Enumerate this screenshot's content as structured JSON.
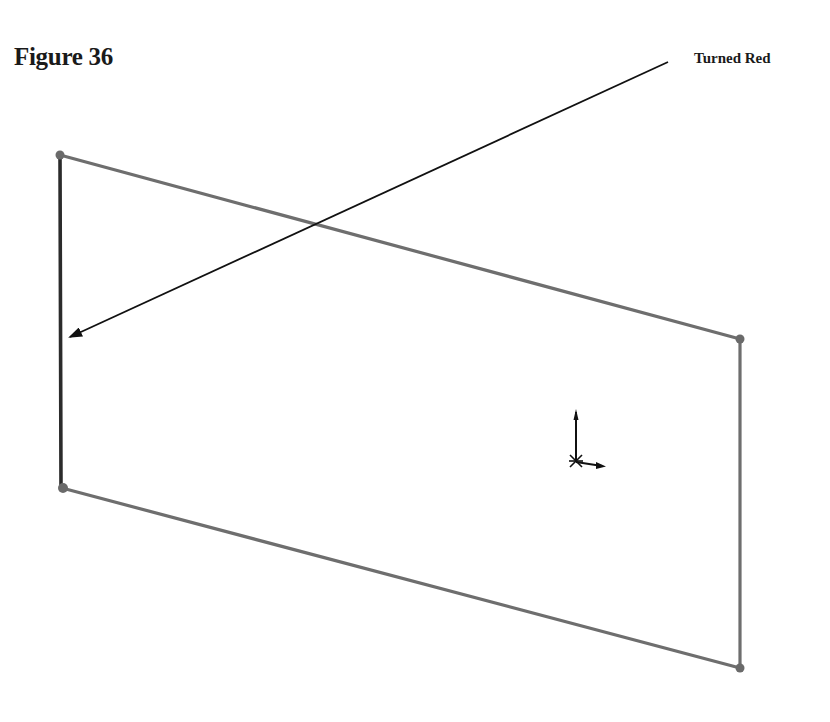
{
  "figure": {
    "label": "Figure 36",
    "callout": "Turned Red"
  },
  "sketch": {
    "colors": {
      "edge": "#6e6e6e",
      "selected_edge": "#2b2b2b",
      "vertex": "#6a6a6a",
      "arrow": "#111111",
      "origin": "#111111"
    },
    "vertices": [
      {
        "name": "top-left",
        "x": 60,
        "y": 155
      },
      {
        "name": "top-right",
        "x": 740,
        "y": 339
      },
      {
        "name": "bottom-right",
        "x": 740,
        "y": 668
      },
      {
        "name": "bottom-left",
        "x": 62,
        "y": 488
      }
    ],
    "selected_edge": "left-vertical-edge",
    "origin_icon": "sketch-origin-icon"
  }
}
